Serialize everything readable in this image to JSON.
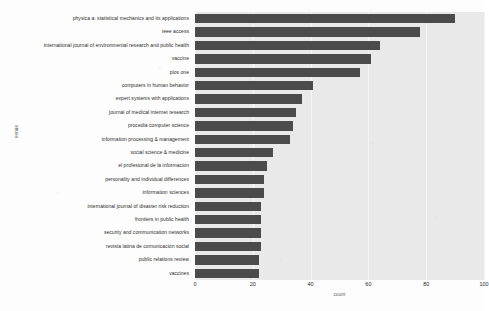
{
  "figure": {
    "title_remnant": "",
    "bar_color": "#4b4b4b",
    "plot_background": "#e9e9e9",
    "page_background": "#fdfdfd"
  },
  "axes": {
    "xlabel": "count",
    "ylabel": "venue",
    "xticks": [
      "0",
      "20",
      "40",
      "60",
      "80",
      "100"
    ]
  },
  "chart_data": {
    "type": "bar",
    "orientation": "horizontal",
    "title": "",
    "xlabel": "count",
    "ylabel": "venue",
    "xlim": [
      0,
      100
    ],
    "xticks": [
      0,
      20,
      40,
      60,
      80,
      100
    ],
    "grid": true,
    "legend": null,
    "categories": [
      "physica a: statistical mechanics and its applications",
      "ieee access",
      "international journal of environmental research and public health",
      "vaccine",
      "plos one",
      "computers in human behavior",
      "expert systems with applications",
      "journal of medical internet research",
      "procedia computer science",
      "information processing & management",
      "social science & medicine",
      "el profesional de la informacion",
      "personality and individual differences",
      "information sciences",
      "international journal of disaster risk reduction",
      "frontiers in public health",
      "security and communication networks",
      "revista latina de comunicacion social",
      "public relations review",
      "vaccines"
    ],
    "values": [
      90,
      78,
      64,
      61,
      57,
      41,
      37,
      35,
      34,
      33,
      27,
      25,
      24,
      24,
      23,
      23,
      23,
      23,
      22,
      22
    ]
  }
}
